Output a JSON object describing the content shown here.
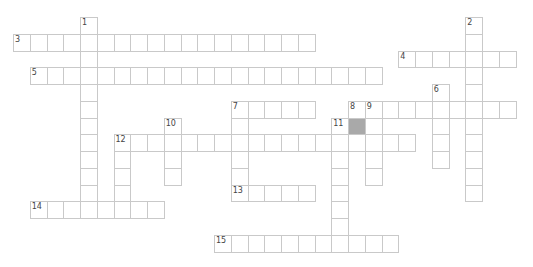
{
  "puzzle": {
    "type": "crossword",
    "grid_origin": {
      "x": 13,
      "y": 17
    },
    "cell_size": 16.75,
    "colors": {
      "line": "#c9c9c9",
      "blocked": "#a9a9a9",
      "number": "#444444",
      "background": "#ffffff"
    },
    "entries": [
      {
        "number": "1",
        "direction": "down",
        "row": 0,
        "col": 4,
        "length": 12
      },
      {
        "number": "2",
        "direction": "down",
        "row": 0,
        "col": 27,
        "length": 11
      },
      {
        "number": "3",
        "direction": "across",
        "row": 1,
        "col": 0,
        "length": 18
      },
      {
        "number": "4",
        "direction": "across",
        "row": 2,
        "col": 23,
        "length": 7
      },
      {
        "number": "5",
        "direction": "across",
        "row": 3,
        "col": 1,
        "length": 21
      },
      {
        "number": "6",
        "direction": "down",
        "row": 4,
        "col": 25,
        "length": 5
      },
      {
        "number": "7",
        "direction": "across",
        "row": 5,
        "col": 13,
        "length": 5
      },
      {
        "number": "7",
        "direction": "down",
        "row": 5,
        "col": 13,
        "length": 6
      },
      {
        "number": "8",
        "direction": "down",
        "row": 5,
        "col": 20,
        "length": 1
      },
      {
        "number": "9",
        "direction": "across",
        "row": 5,
        "col": 21,
        "length": 9
      },
      {
        "number": "9",
        "direction": "down",
        "row": 5,
        "col": 21,
        "length": 5
      },
      {
        "number": "10",
        "direction": "down",
        "row": 6,
        "col": 9,
        "length": 4
      },
      {
        "number": "11",
        "direction": "down",
        "row": 6,
        "col": 19,
        "length": 8
      },
      {
        "number": "12",
        "direction": "across",
        "row": 7,
        "col": 6,
        "length": 18
      },
      {
        "number": "12",
        "direction": "down",
        "row": 7,
        "col": 6,
        "length": 5
      },
      {
        "number": "13",
        "direction": "across",
        "row": 10,
        "col": 13,
        "length": 5
      },
      {
        "number": "14",
        "direction": "across",
        "row": 11,
        "col": 1,
        "length": 8
      },
      {
        "number": "15",
        "direction": "across",
        "row": 13,
        "col": 12,
        "length": 11
      }
    ],
    "blocked_cells": [
      {
        "row": 6,
        "col": 20
      }
    ]
  }
}
